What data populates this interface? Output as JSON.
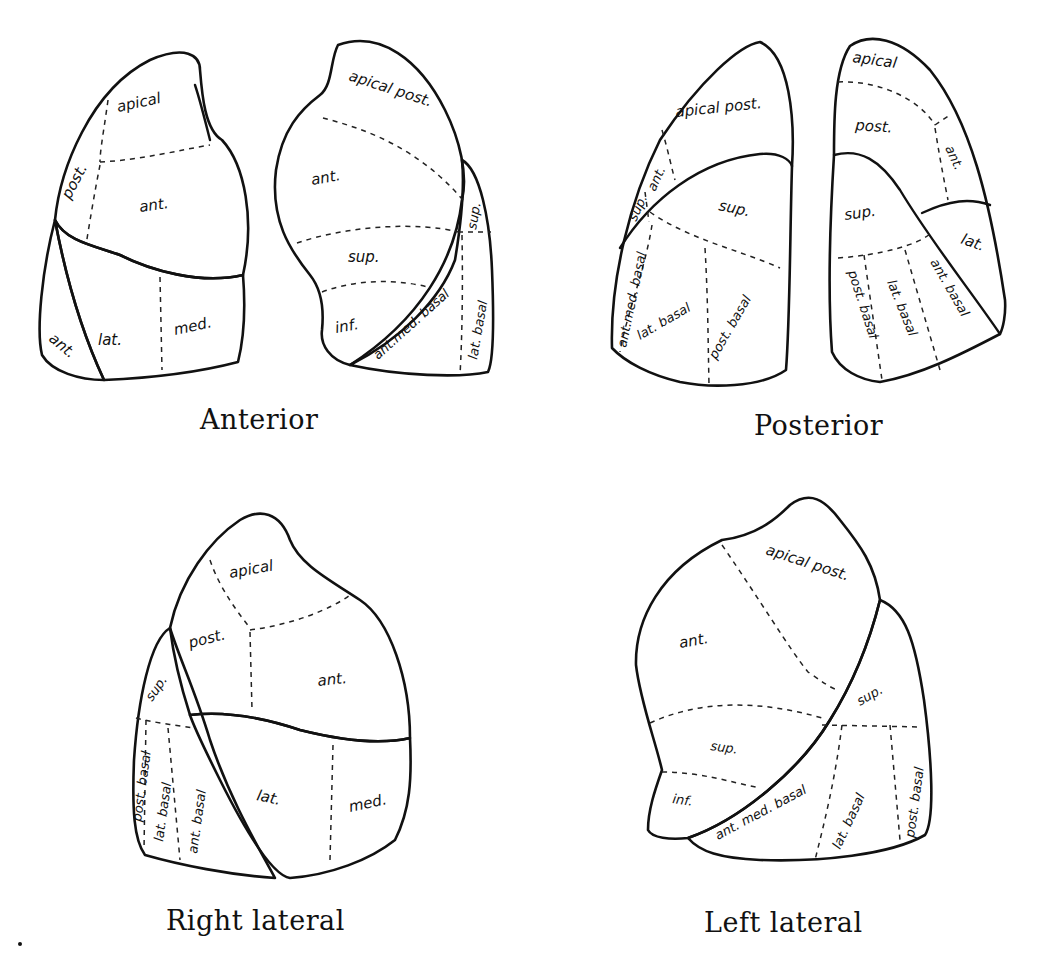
{
  "figure": {
    "views": [
      {
        "id": "anterior",
        "caption": "Anterior",
        "right_lung_labels": [
          "apical",
          "post.",
          "ant.",
          "lat.",
          "med.",
          "ant."
        ],
        "left_lung_labels": [
          "apical post.",
          "ant.",
          "sup.",
          "inf.",
          "ant.med. basal",
          "lat. basal",
          "sup."
        ]
      },
      {
        "id": "posterior",
        "caption": "Posterior",
        "left_lung_labels": [
          "apical post.",
          "ant.",
          "sup.",
          "sup.",
          "ant.med. basal",
          "lat. basal",
          "post. basal"
        ],
        "right_lung_labels": [
          "apical",
          "post.",
          "ant.",
          "sup.",
          "lat.",
          "post. basal",
          "lat. basal",
          "ant. basal"
        ]
      },
      {
        "id": "right-lateral",
        "caption": "Right lateral",
        "labels": [
          "apical",
          "post.",
          "ant.",
          "sup.",
          "post. basal",
          "lat. basal",
          "ant. basal",
          "lat.",
          "med."
        ]
      },
      {
        "id": "left-lateral",
        "caption": "Left lateral",
        "labels": [
          "apical post.",
          "ant.",
          "sup.",
          "inf.",
          "sup.",
          "ant. med. basal",
          "lat. basal",
          "post. basal"
        ]
      }
    ]
  },
  "labels": {
    "ant_r": {
      "apical": "apical",
      "post": "post.",
      "ant_upper": "ant.",
      "lat": "lat.",
      "med": "med.",
      "ant_lower": "ant."
    },
    "ant_l": {
      "apical_post": "apical post.",
      "ant": "ant.",
      "sup": "sup.",
      "inf": "inf.",
      "ant_med_basal": "ant.med. basal",
      "lat_basal": "lat. basal",
      "sup_lower": "sup."
    },
    "post_l": {
      "apical_post": "apical post.",
      "ant": "ant.",
      "sup_upper": "sup.",
      "sup_lower": "sup.",
      "ant_med_basal": "ant.med. basal",
      "lat_basal": "lat. basal",
      "post_basal": "post. basal"
    },
    "post_r": {
      "apical": "apical",
      "post": "post.",
      "ant": "ant.",
      "sup": "sup.",
      "lat": "lat.",
      "post_basal": "post. basal",
      "lat_basal": "lat. basal",
      "ant_basal": "ant. basal"
    },
    "rl": {
      "apical": "apical",
      "post": "post.",
      "ant": "ant.",
      "sup": "sup.",
      "post_basal": "post. basal",
      "lat_basal": "lat. basal",
      "ant_basal": "ant. basal",
      "lat": "lat.",
      "med": "med."
    },
    "ll": {
      "apical_post": "apical post.",
      "ant": "ant.",
      "sup_upper": "sup.",
      "inf": "inf.",
      "sup_lower": "sup.",
      "ant_med_basal": "ant. med. basal",
      "lat_basal": "lat. basal",
      "post_basal": "post. basal"
    }
  },
  "captions": {
    "anterior": "Anterior",
    "posterior": "Posterior",
    "right_lateral": "Right lateral",
    "left_lateral": "Left lateral"
  }
}
